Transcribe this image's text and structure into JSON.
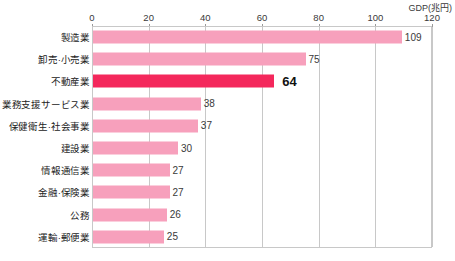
{
  "chart_data": {
    "type": "bar",
    "orientation": "horizontal",
    "title": "",
    "subtitle": "",
    "axis_title": "GDP(兆円)",
    "xlabel": "GDP(兆円)",
    "ylabel": "",
    "xlim": [
      0,
      120
    ],
    "xticks": [
      0,
      20,
      40,
      60,
      80,
      100,
      120
    ],
    "tick_labels": [
      "0",
      "20",
      "40",
      "60",
      "80",
      "100",
      "120"
    ],
    "grid": true,
    "grid_axis": "x",
    "legend": "none",
    "highlight_category": "不動産業",
    "colors": {
      "bar": "#f7a0bc",
      "bar_highlight": "#f4285c",
      "grid": "#c8c8c8",
      "text": "#222222",
      "value_text": "#3a3a3a"
    },
    "categories": [
      "製造業",
      "卸売·小売業",
      "不動産業",
      "業務支援サービス業",
      "保健衛生·社会事業",
      "建設業",
      "情報通信業",
      "金融·保険業",
      "公務",
      "運輸·郵便業"
    ],
    "values": [
      109,
      75,
      64,
      38,
      37,
      30,
      27,
      27,
      26,
      25
    ],
    "value_labels": [
      "109",
      "75",
      "64",
      "38",
      "37",
      "30",
      "27",
      "27",
      "26",
      "25"
    ],
    "highlighted": [
      false,
      false,
      true,
      false,
      false,
      false,
      false,
      false,
      false,
      false
    ]
  }
}
